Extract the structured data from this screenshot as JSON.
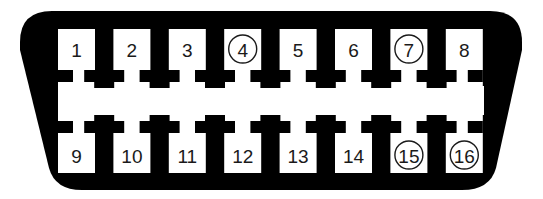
{
  "diagram": {
    "type": "connector-pinout",
    "connector": "16-pin trapezoidal connector (2 rows × 8)",
    "colors": {
      "body": "#000000",
      "cavity": "#ffffff",
      "text": "#1a1a1a"
    },
    "top_row": [
      {
        "pin": "1",
        "circled": false
      },
      {
        "pin": "2",
        "circled": false
      },
      {
        "pin": "3",
        "circled": false
      },
      {
        "pin": "4",
        "circled": true
      },
      {
        "pin": "5",
        "circled": false
      },
      {
        "pin": "6",
        "circled": false
      },
      {
        "pin": "7",
        "circled": true
      },
      {
        "pin": "8",
        "circled": false
      }
    ],
    "bottom_row": [
      {
        "pin": "9",
        "circled": false
      },
      {
        "pin": "10",
        "circled": false
      },
      {
        "pin": "11",
        "circled": false
      },
      {
        "pin": "12",
        "circled": false
      },
      {
        "pin": "13",
        "circled": false
      },
      {
        "pin": "14",
        "circled": false
      },
      {
        "pin": "15",
        "circled": true
      },
      {
        "pin": "16",
        "circled": true
      }
    ],
    "circled_pins": [
      "4",
      "7",
      "15",
      "16"
    ]
  }
}
